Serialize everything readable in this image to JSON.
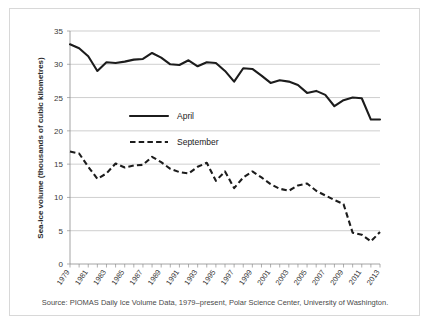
{
  "figure": {
    "source_note": "Source: PIOMAS Daily Ice Volume Data, 1979–present, Polar Science Center, University of Washington.",
    "frame_color": "#d8d8d8",
    "background": "#ffffff",
    "line_color": "#1c1c1c"
  },
  "legend": {
    "position": "inside-upper-left",
    "entries": [
      {
        "label": "April",
        "style": "solid"
      },
      {
        "label": "September",
        "style": "dashed"
      }
    ]
  },
  "chart_data": {
    "type": "line",
    "title": "",
    "xlabel": "",
    "ylabel": "Sea-ice volume (thousands of cubic kilometres)",
    "ylim": [
      0,
      35
    ],
    "xlim": [
      1979,
      2013
    ],
    "yticks": [
      0,
      5,
      10,
      15,
      20,
      25,
      30,
      35
    ],
    "ytick_labels": [
      "0",
      "5",
      "10",
      "15",
      "20",
      "25",
      "30",
      "35"
    ],
    "grid": "horizontal",
    "x": [
      1979,
      1980,
      1981,
      1982,
      1983,
      1984,
      1985,
      1986,
      1987,
      1988,
      1989,
      1990,
      1991,
      1992,
      1993,
      1994,
      1995,
      1996,
      1997,
      1998,
      1999,
      2000,
      2001,
      2002,
      2003,
      2004,
      2005,
      2006,
      2007,
      2008,
      2009,
      2010,
      2011,
      2012,
      2013
    ],
    "xtick_labels": [
      "1979",
      "1981",
      "1983",
      "1985",
      "1987",
      "1989",
      "1991",
      "1993",
      "1995",
      "1997",
      "1999",
      "2001",
      "2003",
      "2005",
      "2007",
      "2009",
      "2011",
      "2013"
    ],
    "xtick_label_rotation": -55,
    "series": [
      {
        "name": "April",
        "style": "solid",
        "values": [
          33.0,
          32.4,
          31.2,
          29.0,
          30.3,
          30.2,
          30.4,
          30.7,
          30.8,
          31.7,
          31.0,
          30.0,
          29.9,
          30.6,
          29.7,
          30.3,
          30.2,
          29.0,
          27.4,
          29.4,
          29.3,
          28.3,
          27.2,
          27.6,
          27.4,
          26.9,
          25.7,
          26.0,
          25.4,
          23.7,
          24.6,
          25.0,
          24.9,
          21.7,
          21.7
        ]
      },
      {
        "name": "September",
        "style": "dashed",
        "values": [
          16.9,
          16.6,
          14.6,
          12.8,
          13.6,
          15.1,
          14.5,
          14.8,
          14.9,
          16.1,
          15.3,
          14.3,
          13.8,
          13.6,
          14.6,
          15.2,
          12.5,
          13.9,
          11.4,
          13.0,
          13.9,
          13.0,
          12.0,
          11.3,
          11.0,
          11.8,
          12.1,
          11.0,
          10.3,
          9.6,
          9.0,
          6.4,
          6.9,
          7.1,
          4.7
        ]
      }
    ],
    "series_extra_notes": {
      "September_late_dip": [
        4.7,
        4.4,
        3.4,
        4.8
      ]
    }
  }
}
